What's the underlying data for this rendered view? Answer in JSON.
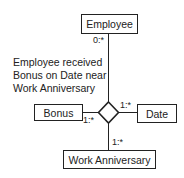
{
  "diagram": {
    "type": "n-ary association (ternary+) class diagram",
    "classes": [
      {
        "id": "employee",
        "name": "Employee"
      },
      {
        "id": "bonus",
        "name": "Bonus"
      },
      {
        "id": "date",
        "name": "Date"
      },
      {
        "id": "work_anniversary",
        "name": "Work Anniversary"
      }
    ],
    "association": {
      "shape": "diamond",
      "description_lines": [
        "Employee received",
        "Bonus on Date near",
        "Work Anniversary"
      ],
      "ends": [
        {
          "class": "employee",
          "multiplicity": "0:*"
        },
        {
          "class": "bonus",
          "multiplicity": "1:*"
        },
        {
          "class": "date",
          "multiplicity": "1:*"
        },
        {
          "class": "work_anniversary",
          "multiplicity": "1:*"
        }
      ]
    },
    "colors": {
      "stroke": "#222222",
      "background": "#ffffff",
      "text": "#222222"
    }
  }
}
